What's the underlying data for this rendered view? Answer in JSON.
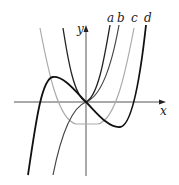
{
  "figure": {
    "axes": {
      "x_label": "x",
      "y_label": "y"
    },
    "curves": [
      {
        "label": "a",
        "color": "#222222",
        "kind": "even, through origin"
      },
      {
        "label": "b",
        "color": "#444444",
        "kind": "odd, through origin"
      },
      {
        "label": "c",
        "color": "#aaaaaa",
        "kind": "even, minimum below origin"
      },
      {
        "label": "d",
        "color": "#111111",
        "kind": "cubic with local max and min"
      }
    ]
  }
}
